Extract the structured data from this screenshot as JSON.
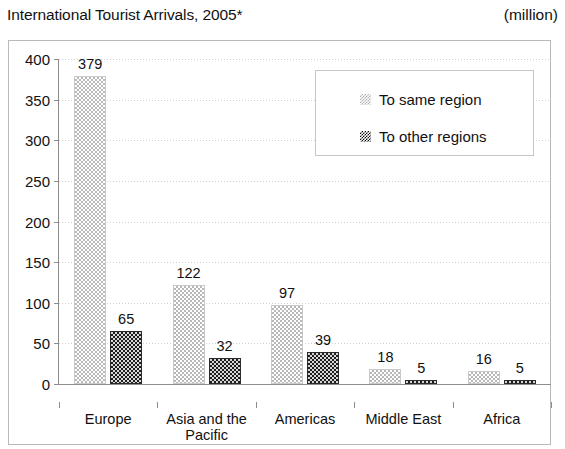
{
  "header": {
    "title": "International Tourist Arrivals, 2005*",
    "unit": "(million)"
  },
  "chart_data": {
    "type": "bar",
    "title": "International Tourist Arrivals, 2005*",
    "subtitle": "(million)",
    "xlabel": "",
    "ylabel": "",
    "ylim": [
      0,
      400
    ],
    "yticks": [
      0,
      50,
      100,
      150,
      200,
      250,
      300,
      350,
      400
    ],
    "ytick_labels": [
      "0",
      "50",
      "100",
      "150",
      "200",
      "250",
      "300",
      "350",
      "400"
    ],
    "grid": true,
    "legend_position": "upper right",
    "categories": [
      "Europe",
      "Asia and the\nPacific",
      "Americas",
      "Middle East",
      "Africa"
    ],
    "category_labels": [
      "Europe",
      "Asia and the Pacific",
      "Americas",
      "Middle East",
      "Africa"
    ],
    "series": [
      {
        "name": "To same region",
        "color": "#c8c8c8",
        "values": [
          379,
          122,
          97,
          18,
          16
        ],
        "value_labels": [
          "379",
          "122",
          "97",
          "18",
          "16"
        ]
      },
      {
        "name": "To other regions",
        "color": "#3a3a3a",
        "values": [
          65,
          32,
          39,
          5,
          5
        ],
        "value_labels": [
          "65",
          "32",
          "39",
          "5",
          "5"
        ]
      }
    ]
  },
  "legend": {
    "items": [
      {
        "label": "To same region",
        "swatch": "light-checker-swatch"
      },
      {
        "label": "To other regions",
        "swatch": "dark-checker-swatch"
      }
    ]
  }
}
